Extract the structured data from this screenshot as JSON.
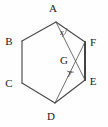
{
  "figure": {
    "type": "geometry-diagram",
    "shape": "hexagon",
    "background_color": "#fefefe",
    "stroke_color": "#4a4a4a",
    "label_color": "#1b1b1b",
    "vertices": [
      {
        "id": "A",
        "label": "A",
        "x": 56,
        "y": 22,
        "label_x": 53,
        "label_y": 12
      },
      {
        "id": "B",
        "label": "B",
        "x": 22,
        "y": 41,
        "label_x": 9,
        "label_y": 45
      },
      {
        "id": "C",
        "label": "C",
        "x": 22,
        "y": 83,
        "label_x": 9,
        "label_y": 87
      },
      {
        "id": "D",
        "label": "D",
        "x": 55,
        "y": 103,
        "label_x": 51,
        "label_y": 120
      },
      {
        "id": "E",
        "label": "E",
        "x": 85,
        "y": 80,
        "label_x": 90,
        "label_y": 85
      },
      {
        "id": "F",
        "label": "F",
        "x": 85,
        "y": 42,
        "label_x": 90,
        "label_y": 46
      }
    ],
    "interior_points": [
      {
        "id": "G",
        "label": "G",
        "x": 72,
        "y": 64,
        "label_x": 63,
        "label_y": 64
      }
    ],
    "edges": [
      {
        "from": "A",
        "to": "B",
        "style": "normal"
      },
      {
        "from": "B",
        "to": "C",
        "style": "normal"
      },
      {
        "from": "C",
        "to": "D",
        "style": "normal"
      },
      {
        "from": "D",
        "to": "E",
        "style": "normal"
      },
      {
        "from": "E",
        "to": "F",
        "style": "heavy"
      },
      {
        "from": "F",
        "to": "A",
        "style": "normal"
      }
    ],
    "diagonals": [
      {
        "from": "A",
        "to": "E",
        "style": "thin"
      },
      {
        "from": "D",
        "to": "F",
        "style": "thin"
      }
    ],
    "angles": [
      {
        "id": "x",
        "label": "x",
        "at_vertex": "A",
        "label_x": 62,
        "label_y": 35
      },
      {
        "id": "y",
        "label": "y",
        "at_vertex": "G",
        "label_x": 69,
        "label_y": 74
      }
    ]
  }
}
